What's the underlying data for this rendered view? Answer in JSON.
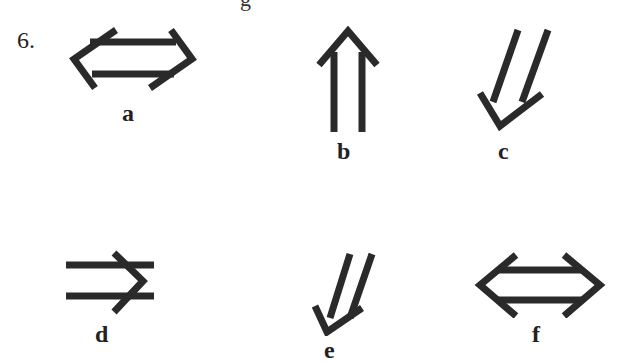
{
  "question": {
    "number": "6.",
    "partial_text_top": "g"
  },
  "arrows": [
    {
      "label": "a",
      "icon": "double-headed-double-arrow-horizontal-icon"
    },
    {
      "label": "b",
      "icon": "double-arrow-up-icon"
    },
    {
      "label": "c",
      "icon": "double-arrow-down-left-icon"
    },
    {
      "label": "d",
      "icon": "double-arrow-right-icon"
    },
    {
      "label": "e",
      "icon": "double-arrow-down-left-icon"
    },
    {
      "label": "f",
      "icon": "double-headed-double-arrow-horizontal-icon"
    }
  ],
  "colors": {
    "stroke": "#2a2a2a",
    "background": "#ffffff"
  }
}
